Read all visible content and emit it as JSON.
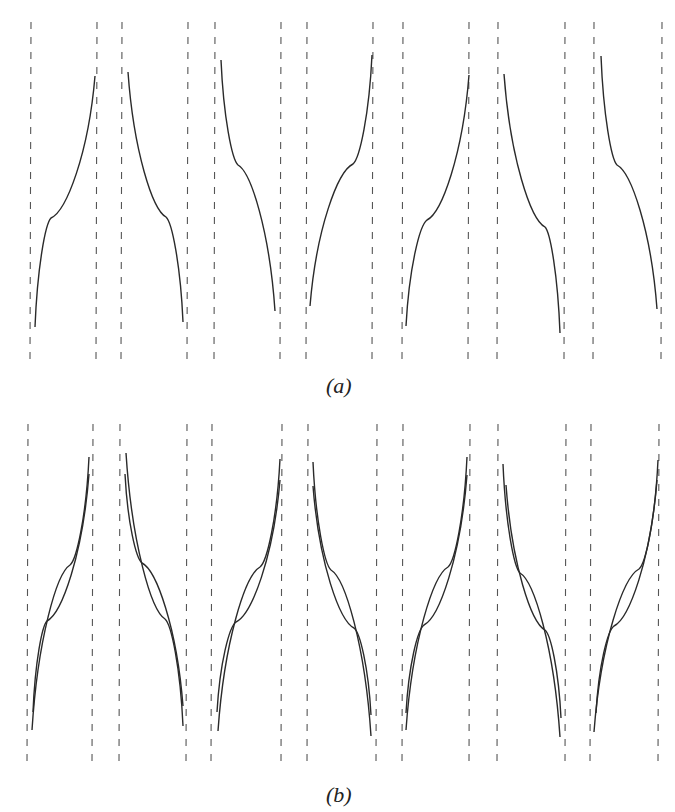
{
  "figure": {
    "panels": [
      {
        "id": "a",
        "label": "(a)",
        "label_pos": {
          "x": 326,
          "y": 373
        },
        "top": 22,
        "bottom": 360,
        "cells": [
          {
            "left": 31,
            "right": 97,
            "orient": "up",
            "curves": [
              {
                "x0": 35,
                "y0": 327,
                "xk": 51,
                "yk": 218,
                "x1": 95,
                "y1": 76
              }
            ]
          },
          {
            "left": 122,
            "right": 188,
            "orient": "down",
            "curves": [
              {
                "x0": 128,
                "y0": 72,
                "xk": 166,
                "yk": 217,
                "x1": 183,
                "y1": 322
              }
            ]
          },
          {
            "left": 215,
            "right": 281,
            "orient": "down",
            "curves": [
              {
                "x0": 221,
                "y0": 60,
                "xk": 238,
                "yk": 165,
                "x1": 275,
                "y1": 311
              }
            ]
          },
          {
            "left": 307,
            "right": 373,
            "orient": "up",
            "curves": [
              {
                "x0": 310,
                "y0": 306,
                "xk": 353,
                "yk": 164,
                "x1": 372,
                "y1": 55
              }
            ]
          },
          {
            "left": 403,
            "right": 469,
            "orient": "up",
            "curves": [
              {
                "x0": 406,
                "y0": 326,
                "xk": 427,
                "yk": 220,
                "x1": 469,
                "y1": 75
              }
            ]
          },
          {
            "left": 498,
            "right": 565,
            "orient": "down",
            "curves": [
              {
                "x0": 504,
                "y0": 74,
                "xk": 545,
                "yk": 227,
                "x1": 560,
                "y1": 333
              }
            ]
          },
          {
            "left": 594,
            "right": 662,
            "orient": "down",
            "curves": [
              {
                "x0": 601,
                "y0": 56,
                "xk": 617,
                "yk": 165,
                "x1": 657,
                "y1": 309
              }
            ]
          }
        ]
      },
      {
        "id": "b",
        "label": "(b)",
        "label_pos": {
          "x": 326,
          "y": 782
        },
        "top": 424,
        "bottom": 765,
        "cells": [
          {
            "left": 28,
            "right": 93,
            "orient": "up",
            "curves": [
              {
                "x0": 32,
                "y0": 730,
                "xk": 70,
                "yk": 565,
                "x1": 89,
                "y1": 457
              },
              {
                "x0": 33,
                "y0": 712,
                "xk": 47,
                "yk": 621,
                "x1": 89,
                "y1": 474
              }
            ]
          },
          {
            "left": 120,
            "right": 187,
            "orient": "down",
            "curves": [
              {
                "x0": 126,
                "y0": 453,
                "xk": 165,
                "yk": 619,
                "x1": 183,
                "y1": 726
              },
              {
                "x0": 125,
                "y0": 474,
                "xk": 142,
                "yk": 563,
                "x1": 183,
                "y1": 706
              }
            ]
          },
          {
            "left": 212,
            "right": 282,
            "orient": "up",
            "curves": [
              {
                "x0": 218,
                "y0": 731,
                "xk": 260,
                "yk": 567,
                "x1": 280,
                "y1": 459
              },
              {
                "x0": 217,
                "y0": 712,
                "xk": 236,
                "yk": 622,
                "x1": 280,
                "y1": 480
              }
            ]
          },
          {
            "left": 308,
            "right": 377,
            "orient": "down",
            "curves": [
              {
                "x0": 313,
                "y0": 462,
                "xk": 331,
                "yk": 570,
                "x1": 371,
                "y1": 736
              },
              {
                "x0": 313,
                "y0": 486,
                "xk": 354,
                "yk": 628,
                "x1": 371,
                "y1": 715
              }
            ]
          },
          {
            "left": 403,
            "right": 470,
            "orient": "up",
            "curves": [
              {
                "x0": 406,
                "y0": 730,
                "xk": 448,
                "yk": 567,
                "x1": 467,
                "y1": 457
              },
              {
                "x0": 406,
                "y0": 713,
                "xk": 424,
                "yk": 625,
                "x1": 467,
                "y1": 475
              }
            ]
          },
          {
            "left": 498,
            "right": 566,
            "orient": "down",
            "curves": [
              {
                "x0": 503,
                "y0": 464,
                "xk": 520,
                "yk": 573,
                "x1": 560,
                "y1": 737
              },
              {
                "x0": 506,
                "y0": 485,
                "xk": 545,
                "yk": 630,
                "x1": 561,
                "y1": 718
              }
            ]
          },
          {
            "left": 591,
            "right": 659,
            "orient": "up",
            "curves": [
              {
                "x0": 594,
                "y0": 732,
                "xk": 639,
                "yk": 569,
                "x1": 658,
                "y1": 460
              },
              {
                "x0": 596,
                "y0": 713,
                "xk": 614,
                "yk": 626,
                "x1": 657,
                "y1": 480
              }
            ]
          }
        ]
      }
    ],
    "style": {
      "curve_color": "#2a2a2a",
      "asymptote_color": "#555555",
      "dash": "7 8"
    }
  }
}
